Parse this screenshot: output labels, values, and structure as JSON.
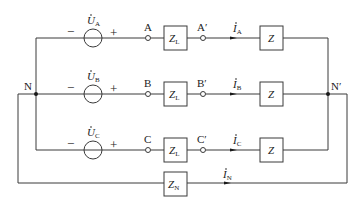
{
  "diagram": {
    "type": "three-phase four-wire Y-Y circuit",
    "nodes": {
      "source_neutral": "N",
      "load_neutral": "N′"
    },
    "phases": [
      {
        "source_label": "U",
        "source_sub": "A",
        "terminal": "A",
        "terminal_prime": "A′",
        "line_impedance": "Z",
        "line_impedance_sub": "L",
        "current": "I",
        "current_sub": "A",
        "load": "Z"
      },
      {
        "source_label": "U",
        "source_sub": "B",
        "terminal": "B",
        "terminal_prime": "B′",
        "line_impedance": "Z",
        "line_impedance_sub": "L",
        "current": "I",
        "current_sub": "B",
        "load": "Z"
      },
      {
        "source_label": "U",
        "source_sub": "C",
        "terminal": "C",
        "terminal_prime": "C′",
        "line_impedance": "Z",
        "line_impedance_sub": "L",
        "current": "I",
        "current_sub": "C",
        "load": "Z"
      }
    ],
    "neutral": {
      "impedance": "Z",
      "impedance_sub": "N",
      "current": "I",
      "current_sub": "N"
    },
    "signs": {
      "minus": "−",
      "plus": "+"
    }
  }
}
